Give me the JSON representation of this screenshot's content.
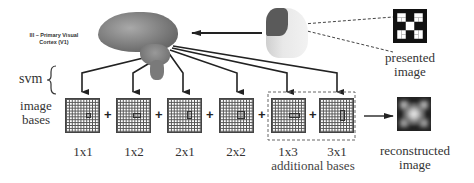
{
  "brain": {
    "label": "III – Primary Visual Cortex (V1)"
  },
  "side_labels": {
    "svm": "svm",
    "image_bases_line1": "image",
    "image_bases_line2": "bases"
  },
  "bases": [
    {
      "label": "1x1",
      "mark": {
        "w": 1,
        "h": 1
      }
    },
    {
      "label": "1x2",
      "mark": {
        "w": 2,
        "h": 1
      }
    },
    {
      "label": "2x1",
      "mark": {
        "w": 1,
        "h": 2
      }
    },
    {
      "label": "2x2",
      "mark": {
        "w": 2,
        "h": 2
      }
    },
    {
      "label": "1x3",
      "mark": {
        "w": 3,
        "h": 1
      }
    },
    {
      "label": "3x1",
      "mark": {
        "w": 1,
        "h": 3
      }
    }
  ],
  "additional_bases_label": "additional bases",
  "presented": {
    "line1": "presented",
    "line2": "image"
  },
  "reconstructed": {
    "line1": "reconstructed",
    "line2": "image"
  },
  "operators": {
    "plus": "+"
  }
}
